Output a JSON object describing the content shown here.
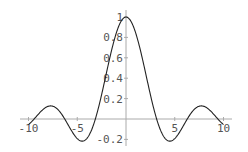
{
  "chart_data": {
    "type": "line",
    "title": "",
    "function": "sin(x)/x",
    "xlabel": "",
    "ylabel": "",
    "xlim": [
      -10,
      10
    ],
    "ylim": [
      -0.22,
      1.0
    ],
    "grid": false,
    "legend": null,
    "x_ticks": [
      {
        "value": -10,
        "label": "-10"
      },
      {
        "value": -5,
        "label": "-5"
      },
      {
        "value": 5,
        "label": "5"
      },
      {
        "value": 10,
        "label": "10"
      }
    ],
    "y_ticks": [
      {
        "value": -0.2,
        "label": "-0.2"
      },
      {
        "value": 0.2,
        "label": "0.2"
      },
      {
        "value": 0.4,
        "label": "0.4"
      },
      {
        "value": 0.6,
        "label": "0.6"
      },
      {
        "value": 0.8,
        "label": "0.8"
      },
      {
        "value": 1.0,
        "label": "1"
      }
    ],
    "series": [
      {
        "name": "sin(x)/x",
        "color": "#222222",
        "x": [
          -10,
          -9,
          -8,
          -7.725,
          -7,
          -6,
          -5,
          -4.493,
          -4,
          -3,
          -2,
          -1,
          0,
          1,
          2,
          3,
          4,
          4.493,
          5,
          6,
          7,
          7.725,
          8,
          9,
          10
        ],
        "y": [
          -0.054,
          0.046,
          0.124,
          0.128,
          0.094,
          -0.047,
          -0.192,
          -0.217,
          -0.189,
          0.047,
          0.455,
          0.841,
          1.0,
          0.841,
          0.455,
          0.047,
          -0.189,
          -0.217,
          -0.192,
          -0.047,
          0.094,
          0.128,
          0.124,
          0.046,
          -0.054
        ]
      }
    ]
  },
  "colors": {
    "axis": "#aaaaaa",
    "curve": "#222222",
    "label": "#555555"
  }
}
